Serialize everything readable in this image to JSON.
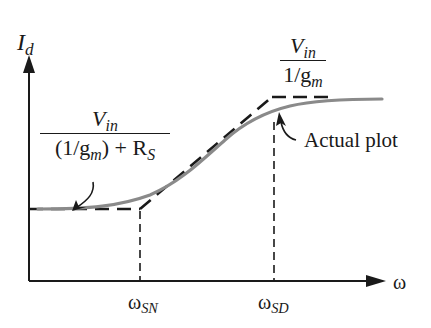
{
  "diagram": {
    "type": "frequency-response-plot",
    "axes": {
      "y_label": "I",
      "y_label_sub": "d",
      "x_label": "ω"
    },
    "x_ticks": [
      {
        "label": "ω",
        "sub": "SN"
      },
      {
        "label": "ω",
        "sub": "SD"
      }
    ],
    "low_level_label": {
      "numerator": "V",
      "numerator_sub": "in",
      "denominator_prefix": "(1/g",
      "denominator_sub": "m",
      "denominator_mid": ") + R",
      "denominator_sub2": "S"
    },
    "high_level_label": {
      "numerator": "V",
      "numerator_sub": "in",
      "denominator_prefix": "1/g",
      "denominator_sub": "m"
    },
    "annotation": "Actual plot",
    "colors": {
      "axis": "#1a1a1a",
      "asymptote": "#1a1a1a",
      "actual_curve": "#8a8a8a",
      "background": "#ffffff"
    }
  }
}
